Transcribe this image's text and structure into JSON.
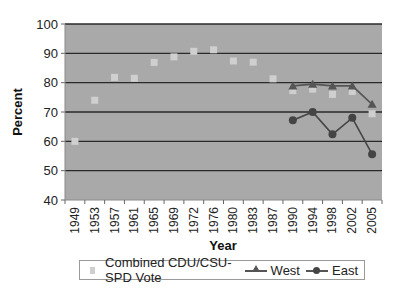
{
  "chart_data": {
    "type": "line",
    "title": "",
    "xlabel": "Year",
    "ylabel": "Percent",
    "ylim": [
      40,
      100
    ],
    "yticks": [
      40,
      50,
      60,
      70,
      80,
      90,
      100
    ],
    "grid": true,
    "legend_position": "bottom",
    "categories": [
      "1949",
      "1953",
      "1957",
      "1961",
      "1965",
      "1969",
      "1972",
      "1976",
      "1980",
      "1983",
      "1987",
      "1990",
      "1994",
      "1998",
      "2002",
      "2005"
    ],
    "series": [
      {
        "name": "Combined CDU/CSU-SPD Vote",
        "marker": "square",
        "line": false,
        "color": "#cfcfcf",
        "values": [
          60.0,
          74.0,
          81.8,
          81.5,
          86.9,
          88.8,
          90.7,
          91.2,
          87.4,
          87.0,
          81.3,
          77.3,
          77.8,
          76.0,
          77.0,
          69.4
        ]
      },
      {
        "name": "West",
        "marker": "triangle",
        "line": true,
        "color": "#555555",
        "values": [
          null,
          null,
          null,
          null,
          null,
          null,
          null,
          null,
          null,
          null,
          null,
          78.9,
          79.5,
          78.9,
          78.9,
          72.6
        ]
      },
      {
        "name": "East",
        "marker": "circle",
        "line": true,
        "color": "#444444",
        "values": [
          null,
          null,
          null,
          null,
          null,
          null,
          null,
          null,
          null,
          null,
          null,
          67.2,
          70.0,
          62.4,
          68.0,
          55.6
        ]
      }
    ]
  },
  "legend": {
    "items": [
      "Combined CDU/CSU-SPD Vote",
      "West",
      "East"
    ]
  },
  "colors": {
    "plot_background": "#a9a9a9",
    "gridline": "#2a2a2a"
  }
}
